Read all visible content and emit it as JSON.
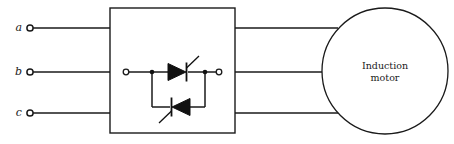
{
  "diagram": {
    "type": "electrical-schematic",
    "stroke_color": "#1a1a1a",
    "background_color": "#ffffff",
    "supply": {
      "terminals": [
        {
          "label": "a",
          "y": 28,
          "terminal_x": 30
        },
        {
          "label": "b",
          "y": 72,
          "terminal_x": 30
        },
        {
          "label": "c",
          "y": 113,
          "terminal_x": 30
        }
      ],
      "line_end_x": 110
    },
    "controller_box": {
      "name": "thyristor-controller",
      "x": 110,
      "y": 8,
      "width": 125,
      "height": 125,
      "label": ""
    },
    "thyristor_pair": {
      "name": "anti-parallel-thyristor-pair",
      "left_terminal_x": 126,
      "right_terminal_x": 219,
      "main_y": 72,
      "branch_y": 107,
      "upper_device": {
        "name": "thyristor-upper",
        "direction": "right",
        "gate": "up-right"
      },
      "lower_device": {
        "name": "thyristor-lower",
        "direction": "left",
        "gate": "down-left"
      }
    },
    "output": {
      "lines_y": [
        28,
        72,
        113
      ],
      "start_x": 235,
      "end_x": 400
    },
    "motor": {
      "name": "induction-motor",
      "label_line1": "Induction",
      "label_line2": "motor",
      "label": "Induction\nmotor",
      "center_x": 385,
      "center_y": 71,
      "radius": 63
    }
  }
}
